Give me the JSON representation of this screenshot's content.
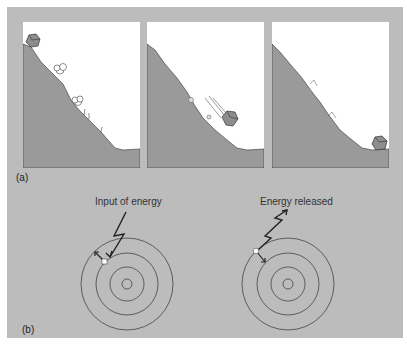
{
  "figure": {
    "part_a": {
      "label": "(a)",
      "panels": [
        {
          "name": "boulder-at-top",
          "description": "Boulder resting at top of slope"
        },
        {
          "name": "boulder-rolling",
          "description": "Boulder rolling down slope"
        },
        {
          "name": "boulder-at-bottom",
          "description": "Boulder at rest at bottom of slope"
        }
      ]
    },
    "part_b": {
      "label": "(b)",
      "left_caption": "Input of energy",
      "right_caption": "Energy released"
    },
    "colors": {
      "background": "#bcbcbc",
      "panel": "#ffffff",
      "hill": "#9a9a9a",
      "line": "#333333"
    }
  }
}
